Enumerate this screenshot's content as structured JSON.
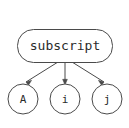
{
  "diagram": {
    "type": "directed-graph",
    "background_color": "#ffffff",
    "stroke_color": "#4a4a4a",
    "text_color": "#2b2b2b",
    "root": {
      "id": "subscript",
      "label": "subscript",
      "shape": "rounded-rectangle"
    },
    "children": [
      {
        "id": "A",
        "label": "A",
        "shape": "circle"
      },
      {
        "id": "i",
        "label": "i",
        "shape": "circle"
      },
      {
        "id": "j",
        "label": "j",
        "shape": "circle"
      }
    ],
    "edges": [
      {
        "from": "subscript",
        "to": "A",
        "arrow": "down-left"
      },
      {
        "from": "subscript",
        "to": "i",
        "arrow": "down"
      },
      {
        "from": "subscript",
        "to": "j",
        "arrow": "down-right"
      }
    ]
  }
}
